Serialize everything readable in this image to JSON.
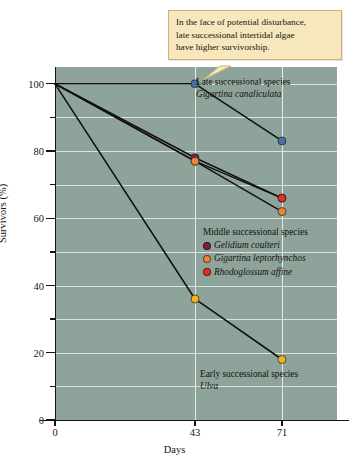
{
  "callout": {
    "lines": [
      "In the face of potential disturbance,",
      "late successional intertidal algae",
      "have higher survivorship."
    ]
  },
  "annotations": {
    "late": {
      "title": "Late successional species",
      "species": "Gigartina canaliculata"
    },
    "early": {
      "title": "Early successional species",
      "species": "Ulva"
    },
    "middle_header": "Middle successional species"
  },
  "colors": {
    "plot_background": "#8ea49b",
    "gridline": "#e8eeea",
    "callout_fill": "#f6e7bc",
    "callout_border": "#cdb274",
    "axis": "#16140f",
    "late_blue": "#4a6ea8",
    "gelidium_purple": "#7a1f4e",
    "gigartina_orange": "#e8863c",
    "rhodoglossum_red": "#e0301f",
    "ulva_gold": "#efb420",
    "line": "#121110"
  },
  "chart_data": {
    "type": "line",
    "title": "",
    "xlabel": "Days",
    "ylabel": "Survivors (%)",
    "xlim": [
      0,
      78
    ],
    "ylim": [
      0,
      105
    ],
    "xticks": [
      0,
      43,
      71
    ],
    "xticklabels": [
      "0",
      "43",
      "71"
    ],
    "yticks": [
      0,
      20,
      40,
      60,
      80,
      100
    ],
    "yticklabels": [
      "0",
      "20",
      "40",
      "60",
      "80",
      "100"
    ],
    "yminorticks": [
      10,
      30,
      50,
      70,
      90
    ],
    "grid": true,
    "legend_position": "inside-right",
    "x": [
      0,
      43,
      71
    ],
    "series": [
      {
        "name": "Gigartina canaliculata",
        "group": "Late successional species",
        "color": "#4a6ea8",
        "values": [
          100,
          100,
          83
        ]
      },
      {
        "name": "Gelidium coulteri",
        "group": "Middle successional species",
        "color": "#7a1f4e",
        "values": [
          100,
          78,
          66
        ]
      },
      {
        "name": "Rhodoglossum affine",
        "group": "Middle successional species",
        "color": "#e0301f",
        "values": [
          100,
          77,
          66
        ]
      },
      {
        "name": "Gigartina leptorhynchos",
        "group": "Middle successional species",
        "color": "#e8863c",
        "values": [
          100,
          77,
          62
        ]
      },
      {
        "name": "Ulva",
        "group": "Early successional species",
        "color": "#efb420",
        "values": [
          100,
          36,
          18
        ]
      }
    ]
  }
}
